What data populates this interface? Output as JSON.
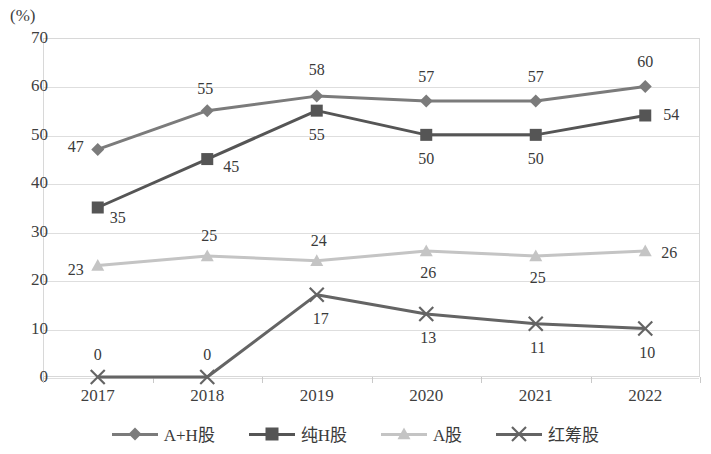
{
  "chart_data": {
    "type": "line",
    "title": "",
    "subtitle": "",
    "xlabel": "",
    "ylabel": "(%)",
    "categories": [
      "2017",
      "2018",
      "2019",
      "2020",
      "2021",
      "2022"
    ],
    "ylim": [
      0,
      70
    ],
    "yticks": [
      0,
      10,
      20,
      30,
      40,
      50,
      60,
      70
    ],
    "grid": true,
    "legend_position": "bottom",
    "series": [
      {
        "name": "A+H股",
        "marker": "diamond",
        "color": "#7b7b7b",
        "values": [
          47,
          55,
          58,
          57,
          57,
          60
        ],
        "labels": [
          "47",
          "55",
          "58",
          "57",
          "57",
          "60"
        ]
      },
      {
        "name": "纯H股",
        "marker": "square",
        "color": "#555555",
        "values": [
          35,
          45,
          55,
          50,
          50,
          54
        ],
        "labels": [
          "35",
          "45",
          "55",
          "50",
          "50",
          "54"
        ]
      },
      {
        "name": "A股",
        "marker": "triangle",
        "color": "#c4c4c4",
        "values": [
          23,
          25,
          24,
          26,
          25,
          26
        ],
        "labels": [
          "23",
          "25",
          "24",
          "26",
          "25",
          "26"
        ]
      },
      {
        "name": "红筹股",
        "marker": "x",
        "color": "#646464",
        "values": [
          0,
          0,
          17,
          13,
          11,
          10
        ],
        "labels": [
          "0",
          "0",
          "17",
          "13",
          "11",
          "10"
        ]
      }
    ]
  },
  "axis": {
    "unit_label": "(%)",
    "y_tick_labels": [
      "70",
      "60",
      "50",
      "40",
      "30",
      "20",
      "10",
      "0"
    ],
    "x_tick_labels": [
      "2017",
      "2018",
      "2019",
      "2020",
      "2021",
      "2022"
    ]
  },
  "legend": {
    "items": [
      {
        "label": "A+H股",
        "marker": "diamond",
        "color": "#7b7b7b"
      },
      {
        "label": "纯H股",
        "marker": "square",
        "color": "#555555"
      },
      {
        "label": "A股",
        "marker": "triangle",
        "color": "#c4c4c4"
      },
      {
        "label": "红筹股",
        "marker": "x",
        "color": "#646464"
      }
    ]
  },
  "label_offsets": {
    "A+H股": [
      [
        -22,
        -2
      ],
      [
        -2,
        -22
      ],
      [
        0,
        -26
      ],
      [
        0,
        -24
      ],
      [
        0,
        -24
      ],
      [
        0,
        -24
      ]
    ],
    "纯H股": [
      [
        20,
        10
      ],
      [
        24,
        8
      ],
      [
        0,
        24
      ],
      [
        0,
        24
      ],
      [
        0,
        24
      ],
      [
        26,
        0
      ]
    ],
    "A股": [
      [
        -22,
        4
      ],
      [
        2,
        -20
      ],
      [
        2,
        -20
      ],
      [
        2,
        22
      ],
      [
        2,
        22
      ],
      [
        24,
        2
      ]
    ],
    "红筹股": [
      [
        0,
        -22
      ],
      [
        0,
        -22
      ],
      [
        4,
        24
      ],
      [
        2,
        24
      ],
      [
        2,
        24
      ],
      [
        2,
        24
      ]
    ]
  }
}
